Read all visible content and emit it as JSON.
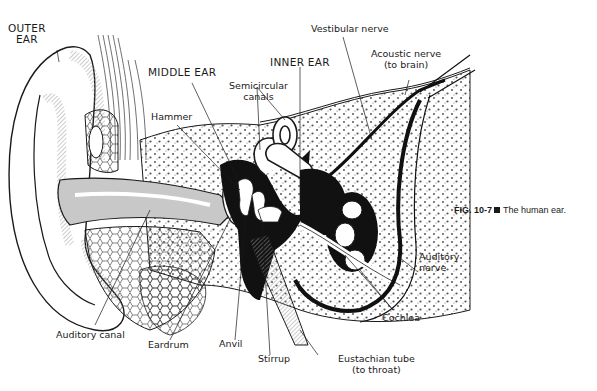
{
  "figure": {
    "caption_number": "FIG. 10-7",
    "caption_separator_icon": "black-square-icon",
    "caption_text": "The human ear."
  },
  "labels": {
    "outer_ear": [
      "OUTER",
      "EAR"
    ],
    "middle_ear": "MIDDLE EAR",
    "inner_ear": "INNER EAR",
    "hammer": "Hammer",
    "semicircular_canals": [
      "Semicircular",
      "canals"
    ],
    "vestibular_nerve": "Vestibular nerve",
    "acoustic_nerve": [
      "Acoustic nerve",
      "(to brain)"
    ],
    "auditory_nerve": [
      "Auditory",
      "nerve"
    ],
    "cochlea": "Cochlea",
    "auditory_canal": "Auditory canal",
    "eardrum": "Eardrum",
    "anvil": "Anvil",
    "stirrup": "Stirrup",
    "eustachian_tube": [
      "Eustachian tube",
      "(to throat)"
    ]
  },
  "colors": {
    "ink": "#1a1a1a",
    "hatch_gray": "#b8b8b8",
    "bone_fill": "#f4f4f4",
    "background": "#ffffff"
  }
}
